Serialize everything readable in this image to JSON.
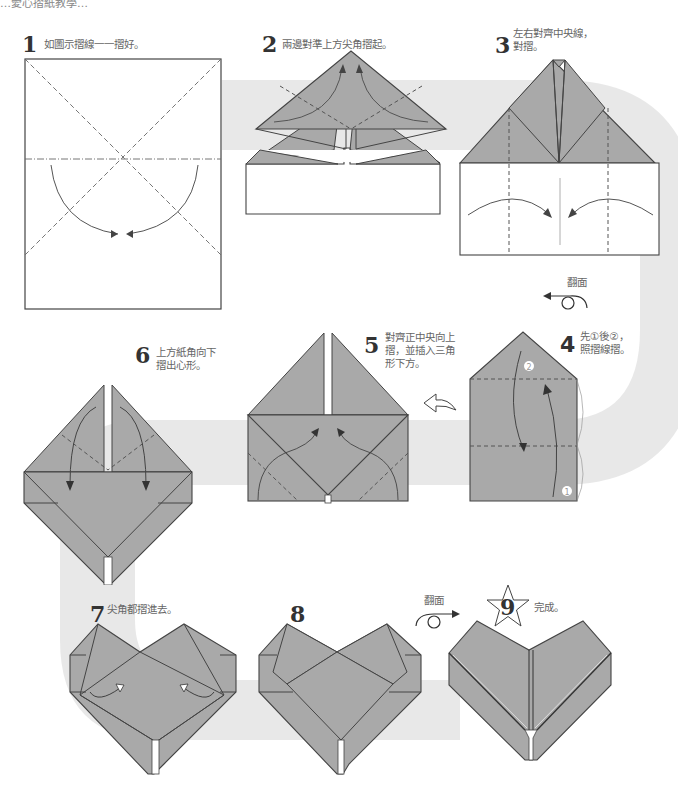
{
  "header": {
    "partial_title": "…愛心摺紙教學…"
  },
  "colors": {
    "paper_fill": "#a9a9a9",
    "paper_stroke": "#444444",
    "path_band": "#e6e6e6",
    "crease": "#555555",
    "white": "#ffffff"
  },
  "steps": [
    {
      "number": "1",
      "text": "如圖示摺線一一摺好。"
    },
    {
      "number": "2",
      "text": "兩邊對準上方尖角摺起。"
    },
    {
      "number": "3",
      "text": "左右對齊中央線，\n對摺。"
    },
    {
      "number": "4",
      "text": "先①後②，\n照摺線摺。"
    },
    {
      "number": "5",
      "text": "對齊正中央向上\n摺，並插入三角\n形下方。"
    },
    {
      "number": "6",
      "text": "上方紙角向下\n摺出心形。"
    },
    {
      "number": "7",
      "text": "尖角都摺進去。"
    },
    {
      "number": "8",
      "text": ""
    },
    {
      "number": "9",
      "text": "完成。"
    }
  ],
  "annotations": {
    "turn_over_1": "翻面",
    "turn_over_2": "翻面",
    "marker_1": "1",
    "marker_2": "2"
  },
  "icons": {
    "turn_over": "turn-over-loop-arrow-icon",
    "curved_arrow": "hollow-curved-arrow-icon",
    "star": "star-icon"
  }
}
